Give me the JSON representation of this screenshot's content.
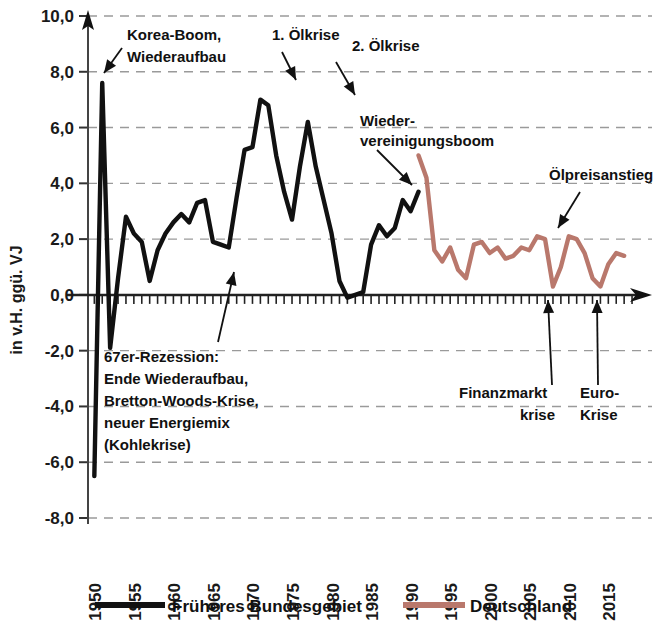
{
  "axes": {
    "ylabel": "in v.H. ggü. VJ",
    "yticks": [
      "10,0",
      "8,0",
      "6,0",
      "4,0",
      "2,0",
      "0,0",
      "-2,0",
      "-4,0",
      "-6,0",
      "-8,0"
    ],
    "xticks": [
      "1950",
      "1955",
      "1960",
      "1965",
      "1970",
      "1975",
      "1980",
      "1985",
      "1990",
      "1995",
      "2000",
      "2005",
      "2010",
      "2015"
    ]
  },
  "legend": {
    "items": [
      {
        "label": "Früheres Bundesgebiet",
        "color": "#111111"
      },
      {
        "label": "Deutschland",
        "color": "#b9786c"
      }
    ]
  },
  "annotations": [
    {
      "id": "korea",
      "lines": [
        "Korea-Boom,",
        "Wiederaufbau"
      ]
    },
    {
      "id": "oil1",
      "lines": [
        "1. Ölkrise"
      ]
    },
    {
      "id": "oil2",
      "lines": [
        "2. Ölkrise"
      ]
    },
    {
      "id": "wiedervereinigung",
      "lines": [
        "Wieder-",
        "vereinigungsboom"
      ]
    },
    {
      "id": "oelpreis",
      "lines": [
        "Ölpreisanstieg"
      ]
    },
    {
      "id": "rezession67",
      "lines": [
        "67er-Rezession:",
        "Ende Wiederaufbau,",
        "Bretton-Woods-Krise,",
        "neuer Energiemix",
        "(Kohlekrise)"
      ]
    },
    {
      "id": "finanzmarktkrise",
      "lines": [
        "Finanzmarkt",
        "krise"
      ]
    },
    {
      "id": "eurokrise",
      "lines": [
        "Euro-",
        "Krise"
      ]
    }
  ],
  "chart_data": {
    "type": "line",
    "title": "",
    "xlabel": "",
    "ylabel": "in v.H. ggü. VJ",
    "xlim": [
      1949.2,
      2018.5
    ],
    "ylim": [
      -8.0,
      10.0
    ],
    "grid": true,
    "legend_position": "bottom",
    "series": [
      {
        "name": "Früheres Bundesgebiet",
        "color": "#111111",
        "x": [
          1950,
          1951,
          1952,
          1953,
          1954,
          1955,
          1956,
          1957,
          1958,
          1959,
          1960,
          1961,
          1962,
          1963,
          1964,
          1965,
          1966,
          1967,
          1968,
          1969,
          1970,
          1971,
          1972,
          1973,
          1974,
          1975,
          1976,
          1977,
          1978,
          1979,
          1980,
          1981,
          1982,
          1983,
          1984,
          1985,
          1986,
          1987,
          1988,
          1989,
          1990,
          1991
        ],
        "y": [
          -6.5,
          7.6,
          -1.9,
          0.6,
          2.8,
          2.2,
          1.9,
          0.5,
          1.6,
          2.2,
          2.6,
          2.9,
          2.6,
          3.3,
          3.4,
          1.9,
          1.8,
          1.7,
          3.5,
          5.2,
          5.3,
          7.0,
          6.8,
          5.0,
          3.7,
          2.7,
          4.6,
          6.2,
          4.6,
          3.4,
          2.2,
          0.5,
          -0.1,
          0.0,
          0.1,
          1.8,
          2.5,
          2.1,
          2.4,
          3.4,
          3.0,
          3.7
        ]
      },
      {
        "name": "Deutschland",
        "color": "#b9786c",
        "x": [
          1991,
          1992,
          1993,
          1994,
          1995,
          1996,
          1997,
          1998,
          1999,
          2000,
          2001,
          2002,
          2003,
          2004,
          2005,
          2006,
          2007,
          2008,
          2009,
          2010,
          2011,
          2012,
          2013,
          2014,
          2015,
          2016,
          2017
        ],
        "y": [
          5.0,
          4.2,
          1.6,
          1.2,
          1.7,
          0.9,
          0.6,
          1.8,
          1.9,
          1.5,
          1.7,
          1.3,
          1.4,
          1.7,
          1.6,
          2.1,
          2.0,
          0.3,
          1.0,
          2.1,
          2.0,
          1.5,
          0.6,
          0.3,
          1.1,
          1.5,
          1.4
        ]
      }
    ]
  }
}
